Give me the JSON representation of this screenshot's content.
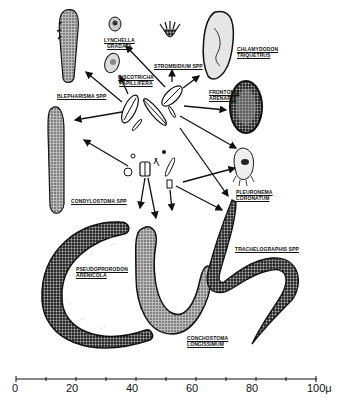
{
  "organisms": [
    {
      "name": "blepharisma",
      "label": "BLEPHARISMA SPP"
    },
    {
      "name": "lynchella",
      "label_line1": "LYNCHELLA",
      "label_line2": "GRADATA"
    },
    {
      "name": "discotricha",
      "label_line1": "DISCOTRICHA",
      "label_line2": "PAPILLIFERA"
    },
    {
      "name": "strombidium",
      "label": "STROMBIDIUM SPP"
    },
    {
      "name": "chlamydodon",
      "label_line1": "CHLAMYDODON",
      "label_line2": "TRIQUETRUS"
    },
    {
      "name": "frontonia",
      "label_line1": "FRONTONIA",
      "label_line2": "ARENARIA"
    },
    {
      "name": "condylostoma",
      "label": "CONDYLOSTOMA SPP"
    },
    {
      "name": "pleuronema",
      "label_line1": "PLEURONEMA",
      "label_line2": "CORONATUM"
    },
    {
      "name": "trachelocerca",
      "label": "TRACHELOGRAPHIS SPP"
    },
    {
      "name": "pseudoprorodon",
      "label_line1": "PSEUDOPRORODON",
      "label_line2": "ARENICOLA"
    },
    {
      "name": "conchostoma",
      "label_line1": "CONCHOSTOMA",
      "label_line2": "LONGISSIMUM"
    }
  ],
  "scale": {
    "ticks": [
      "0",
      "20",
      "40",
      "60",
      "80",
      "100"
    ],
    "unit": "μ",
    "min": 0,
    "max": 100
  }
}
